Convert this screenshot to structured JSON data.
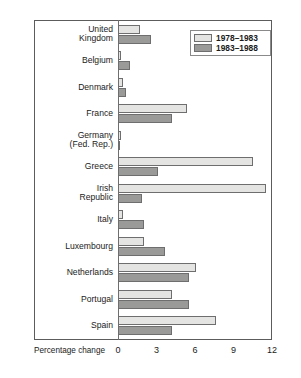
{
  "chart_data": {
    "type": "bar",
    "orientation": "horizontal",
    "title": "",
    "xlabel": "Percentage change",
    "ylabel": "",
    "xlim": [
      0,
      12
    ],
    "xticks": [
      "0",
      "3",
      "6",
      "9",
      "12"
    ],
    "grid": false,
    "legend_position": "top-right",
    "categories": [
      "United\nKingdom",
      "Belgium",
      "Denmark",
      "France",
      "Germany\n(Fed. Rep.)",
      "Greece",
      "Irish\nRepublic",
      "Italy",
      "Luxembourg",
      "Netherlands",
      "Portugal",
      "Spain"
    ],
    "series": [
      {
        "name": "1978–1983",
        "color": "#e4e4e2",
        "values": [
          1.7,
          0.2,
          0.4,
          5.4,
          0.25,
          10.5,
          11.5,
          0.4,
          2.0,
          6.1,
          4.2,
          7.6
        ]
      },
      {
        "name": "1983–1988",
        "color": "#9a9a98",
        "values": [
          2.6,
          0.9,
          0.6,
          4.2,
          0.1,
          3.1,
          1.9,
          2.0,
          3.7,
          5.5,
          5.5,
          4.2
        ]
      }
    ]
  }
}
